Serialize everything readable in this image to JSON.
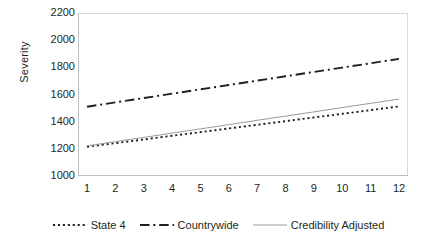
{
  "chart_data": {
    "type": "line",
    "title": "",
    "xlabel": "",
    "ylabel": "Severity",
    "x": [
      1,
      2,
      3,
      4,
      5,
      6,
      7,
      8,
      9,
      10,
      11,
      12
    ],
    "xlim": [
      1,
      12
    ],
    "ylim": [
      1000,
      2200
    ],
    "yticks": [
      1000,
      1200,
      1400,
      1600,
      1800,
      2000,
      2200
    ],
    "xticks": [
      1,
      2,
      3,
      4,
      5,
      6,
      7,
      8,
      9,
      10,
      11,
      12
    ],
    "grid": false,
    "legend_position": "bottom",
    "series": [
      {
        "name": "State 4",
        "style": "dotted",
        "color": "#231f20",
        "values": [
          1215,
          1242,
          1269,
          1296,
          1323,
          1350,
          1377,
          1404,
          1431,
          1458,
          1485,
          1512
        ]
      },
      {
        "name": "Countrywide",
        "style": "dash-dot",
        "color": "#231f20",
        "values": [
          1510,
          1542,
          1574,
          1606,
          1638,
          1670,
          1702,
          1734,
          1766,
          1798,
          1830,
          1862
        ]
      },
      {
        "name": "Credibility Adjusted",
        "style": "solid",
        "color": "#9b9b9b",
        "values": [
          1222,
          1253,
          1284,
          1316,
          1347,
          1378,
          1410,
          1441,
          1472,
          1504,
          1535,
          1566
        ]
      }
    ]
  },
  "axes": {
    "y_title": "Severity",
    "y_tick_labels": [
      "2200",
      "2000",
      "1800",
      "1600",
      "1400",
      "1200",
      "1000"
    ],
    "x_tick_labels": [
      "1",
      "2",
      "3",
      "4",
      "5",
      "6",
      "7",
      "8",
      "9",
      "10",
      "11",
      "12"
    ]
  },
  "legend": {
    "items": [
      {
        "label": "State 4",
        "icon": "dotted-line-swatch",
        "style": "dotted",
        "color": "#231f20"
      },
      {
        "label": "Countrywide",
        "icon": "dash-dot-line-swatch",
        "style": "dash-dot",
        "color": "#231f20"
      },
      {
        "label": "Credibility Adjusted",
        "icon": "solid-line-swatch",
        "style": "solid",
        "color": "#9b9b9b"
      }
    ]
  },
  "colors": {
    "axis": "#bfbfbf",
    "text": "#231f20",
    "series_dark": "#231f20",
    "series_gray": "#9b9b9b",
    "background": "#ffffff"
  }
}
